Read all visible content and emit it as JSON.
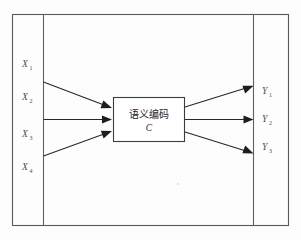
{
  "figure": {
    "type": "encoder-decoder-diagram",
    "background_color": "#fdfdfd",
    "frame": {
      "outer_border_color": "#555a5e",
      "divider_color": "#5c6165",
      "left_divider_x": 43,
      "right_divider_x": 253
    },
    "inputs": [
      {
        "label": "X",
        "subscript": "1",
        "x": 26,
        "y": 67
      },
      {
        "label": "X",
        "subscript": "2",
        "x": 26,
        "y": 100
      },
      {
        "label": "X",
        "subscript": "3",
        "x": 26,
        "y": 137
      },
      {
        "label": "X",
        "subscript": "4",
        "x": 26,
        "y": 170
      }
    ],
    "outputs": [
      {
        "label": "Y",
        "subscript": "1",
        "x": 265,
        "y": 94
      },
      {
        "label": "Y",
        "subscript": "2",
        "x": 265,
        "y": 122
      },
      {
        "label": "Y",
        "subscript": "3",
        "x": 265,
        "y": 150
      }
    ],
    "encoder_box": {
      "cjk_label": "语义编码",
      "symbol_label": "C",
      "x": 113,
      "y": 97,
      "width": 72,
      "height": 45,
      "fill": "#ffffff",
      "stroke": "#3a3d40"
    },
    "input_arrows": [
      {
        "from_x": 43,
        "from_y": 82,
        "to_x": 111,
        "to_y": 107
      },
      {
        "from_x": 43,
        "from_y": 119,
        "to_x": 111,
        "to_y": 119
      },
      {
        "from_x": 43,
        "from_y": 156,
        "to_x": 111,
        "to_y": 132
      }
    ],
    "output_arrows": [
      {
        "from_x": 185,
        "from_y": 107,
        "to_x": 253,
        "to_y": 90
      },
      {
        "from_x": 185,
        "from_y": 119,
        "to_x": 253,
        "to_y": 119
      },
      {
        "from_x": 185,
        "from_y": 132,
        "to_x": 253,
        "to_y": 148
      }
    ],
    "arrow_color": "#26292b",
    "arrow_head_color": "#1b1d1f"
  }
}
